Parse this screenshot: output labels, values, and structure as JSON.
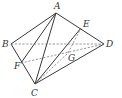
{
  "diagram": {
    "type": "geometry-figure",
    "points": {
      "A": {
        "x": 56,
        "y": 13,
        "label": "A",
        "lx": 54,
        "ly": 9
      },
      "B": {
        "x": 11,
        "y": 44,
        "label": "B",
        "lx": 2,
        "ly": 47
      },
      "C": {
        "x": 35,
        "y": 84,
        "label": "C",
        "lx": 31,
        "ly": 96
      },
      "D": {
        "x": 104,
        "y": 44,
        "label": "D",
        "lx": 106,
        "ly": 47
      },
      "E": {
        "x": 81,
        "y": 28,
        "label": "E",
        "lx": 83,
        "ly": 27
      },
      "F": {
        "x": 21,
        "y": 63,
        "label": "F",
        "lx": 14,
        "ly": 69
      },
      "G": {
        "x": 68,
        "y": 53,
        "label": "G",
        "lx": 68,
        "ly": 61
      }
    },
    "solid_segments": [
      [
        "A",
        "B"
      ],
      [
        "A",
        "D"
      ],
      [
        "B",
        "C"
      ],
      [
        "C",
        "D"
      ],
      [
        "A",
        "F"
      ],
      [
        "A",
        "C"
      ],
      [
        "C",
        "E"
      ]
    ],
    "dashed_segments": [
      [
        "B",
        "D"
      ],
      [
        "F",
        "D"
      ],
      [
        "C",
        "G"
      ],
      [
        "G",
        "E"
      ]
    ],
    "colors": {
      "line": "#3a3a3a",
      "dashed": "#6a6a6a",
      "label": "#333333",
      "background": "#ffffff"
    }
  }
}
